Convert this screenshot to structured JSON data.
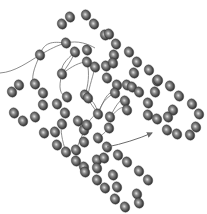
{
  "diagram": {
    "colors": {
      "background": "#ffffff",
      "bead_dark": "#2e2e2e",
      "bead_mid": "#6a6a6a",
      "bead_highlight": "#e0e0e0",
      "thread": "#6f6f6f",
      "arrow": "#6a6a6a"
    },
    "bead_rx": 4.6,
    "bead_ry": 5.3,
    "beads": [
      [
        70,
        17
      ],
      [
        86,
        15
      ],
      [
        62,
        24
      ],
      [
        94,
        24
      ],
      [
        66,
        43
      ],
      [
        40,
        55
      ],
      [
        75,
        52
      ],
      [
        87,
        50
      ],
      [
        87,
        62
      ],
      [
        62,
        74
      ],
      [
        105,
        35
      ],
      [
        109,
        34
      ],
      [
        116,
        44
      ],
      [
        114,
        55
      ],
      [
        129,
        52
      ],
      [
        137,
        62
      ],
      [
        95,
        67
      ],
      [
        106,
        66
      ],
      [
        107,
        78
      ],
      [
        113,
        63
      ],
      [
        134,
        73
      ],
      [
        149,
        70
      ],
      [
        117,
        85
      ],
      [
        127,
        85
      ],
      [
        132,
        87
      ],
      [
        157,
        81
      ],
      [
        158,
        80
      ],
      [
        155,
        92
      ],
      [
        170,
        86
      ],
      [
        179,
        96
      ],
      [
        148,
        103
      ],
      [
        148,
        115
      ],
      [
        173,
        110
      ],
      [
        192,
        104
      ],
      [
        199,
        114
      ],
      [
        196,
        127
      ],
      [
        190,
        135
      ],
      [
        177,
        134
      ],
      [
        167,
        130
      ],
      [
        157,
        119
      ],
      [
        168,
        117
      ],
      [
        139,
        92
      ],
      [
        125,
        101
      ],
      [
        127,
        110
      ],
      [
        85,
        95
      ],
      [
        115,
        93
      ],
      [
        12,
        92
      ],
      [
        19,
        85
      ],
      [
        35,
        84
      ],
      [
        43,
        93
      ],
      [
        14,
        113
      ],
      [
        23,
        121
      ],
      [
        35,
        117
      ],
      [
        43,
        105
      ],
      [
        57,
        104
      ],
      [
        65,
        113
      ],
      [
        62,
        124
      ],
      [
        78,
        121
      ],
      [
        84,
        130
      ],
      [
        44,
        133
      ],
      [
        55,
        132
      ],
      [
        57,
        145
      ],
      [
        66,
        152
      ],
      [
        76,
        150
      ],
      [
        76,
        161
      ],
      [
        84,
        167
      ],
      [
        97,
        160
      ],
      [
        98,
        114
      ],
      [
        110,
        117
      ],
      [
        109,
        128
      ],
      [
        88,
        98
      ],
      [
        67,
        97
      ],
      [
        87,
        125
      ],
      [
        98,
        138
      ],
      [
        84,
        142
      ],
      [
        107,
        147
      ],
      [
        104,
        158
      ],
      [
        118,
        155
      ],
      [
        127,
        162
      ],
      [
        97,
        168
      ],
      [
        97,
        180
      ],
      [
        113,
        175
      ],
      [
        139,
        171
      ],
      [
        148,
        180
      ],
      [
        105,
        188
      ],
      [
        117,
        187
      ],
      [
        115,
        199
      ],
      [
        137,
        194
      ],
      [
        125,
        207
      ],
      [
        139,
        203
      ],
      [
        85,
        172
      ]
    ],
    "threads": [
      "M0,73 C15,72 28,62 40,55 C50,49 58,45 66,43",
      "M40,55 C34,68 30,80 35,84",
      "M40,55 C44,40 56,42 66,43",
      "M66,43 C78,40 88,44 95,48",
      "M62,74 C58,88 60,95 67,97",
      "M62,74 C72,66 80,62 87,62",
      "M75,52 C66,60 60,66 62,74",
      "M75,52 C70,64 64,70 62,74",
      "M87,62 C90,74 88,86 85,95",
      "M95,67 C92,80 88,90 88,98",
      "M98,114 C92,105 88,100 88,98",
      "M98,114 C96,104 92,100 85,95",
      "M98,114 C104,100 108,90 115,93",
      "M98,114 C101,104 106,97 115,93",
      "M87,125 C92,116 96,114 98,114",
      "M110,117 C116,105 122,96 125,101",
      "M110,117 C118,110 122,104 127,110",
      "M109,128 C104,134 100,136 98,138",
      "M66,152 C62,140 60,130 62,124",
      "M76,150 C80,140 84,132 84,130"
    ],
    "arrow": {
      "path": "M107,147 C122,144 138,139 152,133",
      "head": [
        155,
        133
      ]
    }
  }
}
